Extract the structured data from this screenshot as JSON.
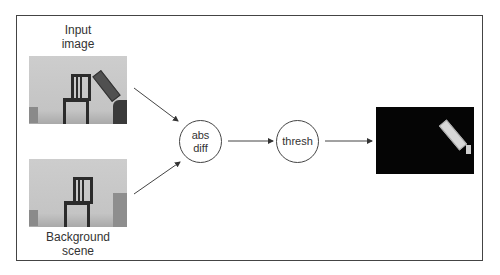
{
  "diagram": {
    "inputs": [
      {
        "label_line1": "Input",
        "label_line2": "image",
        "label_position": "above"
      },
      {
        "label_line1": "Background",
        "label_line2": "scene",
        "label_position": "below"
      }
    ],
    "nodes": [
      {
        "line1": "abs",
        "line2": "diff"
      },
      {
        "line1": "thresh",
        "line2": ""
      }
    ],
    "output": {
      "description": "binary foreground mask"
    },
    "edges": [
      {
        "from": "Input image",
        "to": "abs diff"
      },
      {
        "from": "Background scene",
        "to": "abs diff"
      },
      {
        "from": "abs diff",
        "to": "thresh"
      },
      {
        "from": "thresh",
        "to": "output mask"
      }
    ],
    "colors": {
      "stroke": "#444444",
      "text": "#333333",
      "mask_bg": "#050505"
    }
  }
}
